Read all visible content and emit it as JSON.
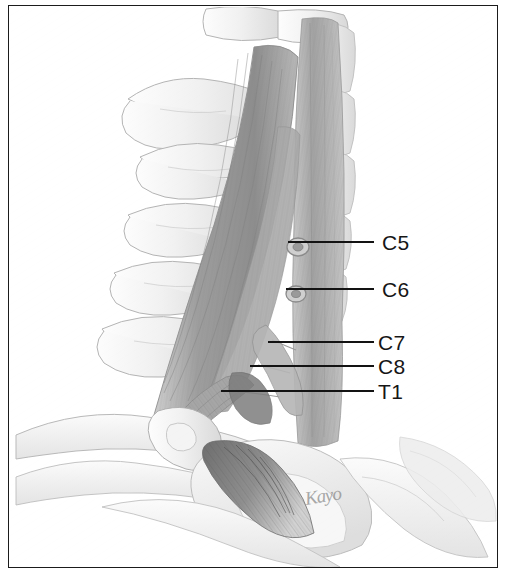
{
  "figure": {
    "medium": "pencil drawing",
    "background_color": "#ffffff",
    "frame_color": "#1b1b1b",
    "label_color": "#161616",
    "leader_color": "#131313"
  },
  "labels": [
    {
      "id": "c5",
      "text": "C5",
      "x": 382,
      "y": 232,
      "leader_x": 288,
      "leader_y": 241,
      "leader_w": 86
    },
    {
      "id": "c6",
      "text": "C6",
      "x": 382,
      "y": 279,
      "leader_x": 286,
      "leader_y": 288,
      "leader_w": 88
    },
    {
      "id": "c7",
      "text": "C7",
      "x": 378,
      "y": 332,
      "leader_x": 268,
      "leader_y": 341,
      "leader_w": 106
    },
    {
      "id": "c8",
      "text": "C8",
      "x": 378,
      "y": 356,
      "leader_x": 250,
      "leader_y": 365,
      "leader_w": 124
    },
    {
      "id": "t1",
      "text": "T1",
      "x": 378,
      "y": 381,
      "leader_x": 221,
      "leader_y": 390,
      "leader_w": 153
    }
  ],
  "signature": {
    "text": "Kayo",
    "x": 305,
    "y": 488
  }
}
